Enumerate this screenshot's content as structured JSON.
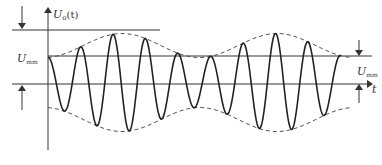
{
  "diagram": {
    "colors": {
      "background": "#ffffff",
      "line": "#333333",
      "envelope": "#555555"
    },
    "labels": {
      "y_axis": {
        "main": "U",
        "sub": "o",
        "suffix": "(t)"
      },
      "left_level": {
        "main": "U",
        "sub": "mm"
      },
      "right_level": {
        "main": "U",
        "sub": "mm"
      },
      "x_axis": "t"
    },
    "geometry": {
      "y_axis_x": 48,
      "y_axis_top": 8,
      "y_axis_bottom": 150,
      "top_line_y": 30,
      "top_line_x": [
        12,
        160
      ],
      "upper_level_y": 56,
      "upper_level_x": [
        48,
        372
      ],
      "time_axis_y": 84,
      "time_axis_x": [
        12,
        374
      ]
    },
    "waveform": {
      "type": "AM carrier",
      "x_start": 48,
      "x_end": 341,
      "center_y": 82.5,
      "carrier_period_px": 32.5,
      "envelope_mean_amp": 37,
      "envelope_mod_amp": 12,
      "envelope_period_px": 155,
      "envelope_peak_x": 122,
      "envelope_x_start": 48,
      "envelope_x_end": 352
    }
  }
}
